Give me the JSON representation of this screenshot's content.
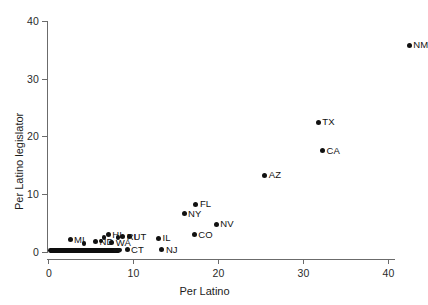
{
  "chart_data": {
    "type": "scatter",
    "title": "",
    "xlabel": "Per Latino",
    "ylabel": "Per Latino legislator",
    "xlim": [
      -1.2,
      44.5
    ],
    "ylim": [
      -1.2,
      41.5
    ],
    "xticks": [
      "0",
      "10",
      "20",
      "30",
      "40"
    ],
    "xtick_values": [
      0,
      10,
      20,
      30,
      40
    ],
    "yticks": [
      "0",
      "10",
      "20",
      "30",
      "40"
    ],
    "ytick_values": [
      0,
      10,
      20,
      30,
      40
    ],
    "grid": false,
    "legend": "none",
    "marker": "filled-circle",
    "marker_color": "#111111",
    "points": [
      {
        "label": "NM",
        "x": 42.5,
        "y": 35.8,
        "label_pos": "right"
      },
      {
        "label": "TX",
        "x": 31.8,
        "y": 22.5,
        "label_pos": "right"
      },
      {
        "label": "CA",
        "x": 32.3,
        "y": 17.5,
        "label_pos": "right"
      },
      {
        "label": "AZ",
        "x": 25.5,
        "y": 13.3,
        "label_pos": "right"
      },
      {
        "label": "FL",
        "x": 17.4,
        "y": 8.3,
        "label_pos": "right"
      },
      {
        "label": "NY",
        "x": 16.0,
        "y": 6.6,
        "label_pos": "right"
      },
      {
        "label": "NV",
        "x": 19.8,
        "y": 4.8,
        "label_pos": "right"
      },
      {
        "label": "CO",
        "x": 17.2,
        "y": 3.0,
        "label_pos": "right"
      },
      {
        "label": "IL",
        "x": 13.0,
        "y": 2.4,
        "label_pos": "right"
      },
      {
        "label": "NJ",
        "x": 13.4,
        "y": 0.35,
        "label_pos": "right"
      },
      {
        "label": "HI",
        "x": 7.1,
        "y": 3.0,
        "label_pos": "right"
      },
      {
        "label": "UT",
        "x": 9.6,
        "y": 2.6,
        "label_pos": "right"
      },
      {
        "label": "RI",
        "x": 8.8,
        "y": 2.6,
        "label_pos": "right"
      },
      {
        "label": "MI",
        "x": 2.6,
        "y": 2.1,
        "label_pos": "right"
      },
      {
        "label": "ND",
        "x": 5.6,
        "y": 1.8,
        "label_pos": "right"
      },
      {
        "label": "WA",
        "x": 7.5,
        "y": 1.6,
        "label_pos": "right"
      },
      {
        "label": "CT",
        "x": 9.3,
        "y": 0.35,
        "label_pos": "right"
      },
      {
        "label": "",
        "x": 6.6,
        "y": 2.5,
        "label_pos": "none"
      },
      {
        "label": "",
        "x": 6.2,
        "y": 1.9,
        "label_pos": "none"
      },
      {
        "label": "",
        "x": 8.2,
        "y": 2.5,
        "label_pos": "none"
      },
      {
        "label": "",
        "x": 4.2,
        "y": 1.5,
        "label_pos": "none"
      },
      {
        "label": "",
        "x": 7.9,
        "y": 0.35,
        "label_pos": "none"
      },
      {
        "label": "",
        "x": 8.4,
        "y": 0.35,
        "label_pos": "none"
      }
    ],
    "dense_band": {
      "description": "solid overlapping cluster of unlabeled state points along y = 0",
      "x_start": 0.0,
      "x_end": 8.6,
      "y": 0.3
    }
  }
}
